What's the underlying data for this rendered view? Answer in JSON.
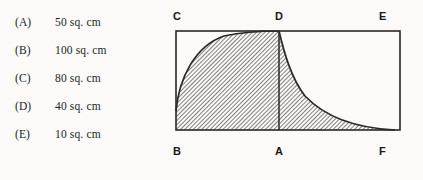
{
  "question": {
    "options": [
      {
        "letter": "(A)",
        "text": "50 sq. cm"
      },
      {
        "letter": "(B)",
        "text": "100 sq. cm"
      },
      {
        "letter": "(C)",
        "text": "80 sq. cm"
      },
      {
        "letter": "(D)",
        "text": "40 sq. cm"
      },
      {
        "letter": "(E)",
        "text": "10 sq. cm"
      }
    ]
  },
  "figure": {
    "type": "geometry-diagram",
    "vertex_labels": [
      {
        "name": "C",
        "position": "top-left"
      },
      {
        "name": "D",
        "position": "top-middle"
      },
      {
        "name": "E",
        "position": "top-right"
      },
      {
        "name": "B",
        "position": "bottom-left"
      },
      {
        "name": "A",
        "position": "bottom-middle"
      },
      {
        "name": "F",
        "position": "bottom-right"
      }
    ],
    "colors": {
      "stroke": "#2b2927",
      "hatch": "#3a3836",
      "background": "#fbfaf8"
    }
  }
}
